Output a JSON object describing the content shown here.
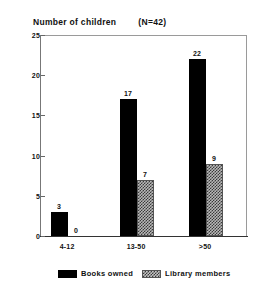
{
  "chart_data": {
    "type": "bar",
    "title": "Number of children",
    "annotation": "(N=42)",
    "subtitle": "",
    "xlabel": "",
    "ylabel": "",
    "categories": [
      "4-12",
      "13-50",
      ">50"
    ],
    "series": [
      {
        "name": "Books owned",
        "values": [
          3,
          17,
          22
        ],
        "color": "#000000",
        "fill": "solid"
      },
      {
        "name": "Library members",
        "values": [
          0,
          7,
          9
        ],
        "color": "#b8b8b8",
        "fill": "crosshatch"
      }
    ],
    "ylim": [
      0,
      25
    ],
    "yticks": [
      0,
      5,
      10,
      15,
      20,
      25
    ],
    "ytick_labels": [
      "0",
      "5",
      "10",
      "15",
      "20",
      "25"
    ],
    "grid": false,
    "data_labels": true,
    "legend_position": "bottom"
  },
  "legend": {
    "items": [
      {
        "label": "Books owned"
      },
      {
        "label": "Library members"
      }
    ]
  }
}
